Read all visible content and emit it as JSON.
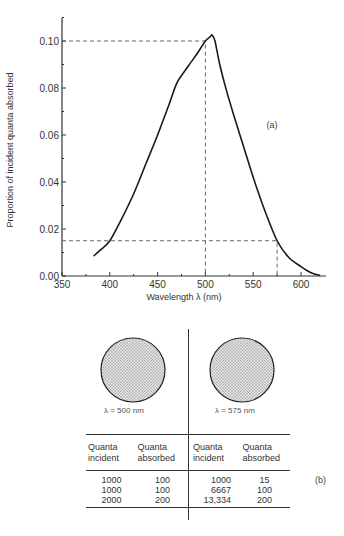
{
  "chart_data": [
    {
      "type": "line",
      "panel": "(a)",
      "title": "",
      "xlabel": "Wavelength λ (nm)",
      "ylabel": "Proportion of incident quanta absorbed",
      "xlim": [
        350,
        625
      ],
      "ylim": [
        0.0,
        0.11
      ],
      "xticks": [
        350,
        400,
        450,
        500,
        550,
        600
      ],
      "yticks": [
        0.0,
        0.02,
        0.04,
        0.06,
        0.08,
        0.1
      ],
      "xtick_labels": [
        "350",
        "400",
        "450",
        "500",
        "550",
        "600"
      ],
      "ytick_labels": [
        "0.00",
        "0.02",
        "0.04",
        "0.06",
        "0.08",
        "0.10"
      ],
      "grid": false,
      "series": [
        {
          "name": "absorption spectrum",
          "x": [
            383,
            390,
            400,
            412,
            425,
            438,
            450,
            462,
            470,
            478,
            485,
            492,
            500,
            505,
            507,
            510,
            515,
            522,
            530,
            540,
            550,
            562,
            575,
            587,
            600,
            610,
            620
          ],
          "y": [
            0.0085,
            0.011,
            0.015,
            0.024,
            0.035,
            0.048,
            0.06,
            0.073,
            0.082,
            0.087,
            0.091,
            0.095,
            0.1,
            0.1018,
            0.1025,
            0.1,
            0.09,
            0.079,
            0.068,
            0.055,
            0.042,
            0.028,
            0.015,
            0.008,
            0.004,
            0.0015,
            0.0002
          ]
        }
      ],
      "annotations": [
        {
          "type": "dashed-reference",
          "x": 500,
          "y": 0.1
        },
        {
          "type": "dashed-reference",
          "x": 575,
          "y": 0.015
        },
        {
          "type": "dashed-reference",
          "x": 400,
          "y": 0.015
        }
      ]
    },
    {
      "type": "table",
      "panel": "(b)",
      "groups": [
        {
          "wavelength_label": "λ = 500  nm",
          "columns": [
            "Quanta incident",
            "Quanta absorbed"
          ],
          "rows": [
            [
              "1000",
              "100"
            ],
            [
              "1000",
              "100"
            ],
            [
              "2000",
              "200"
            ]
          ]
        },
        {
          "wavelength_label": "λ = 575 nm",
          "columns": [
            "Quanta incident",
            "Quanta absorbed"
          ],
          "rows": [
            [
              "1000",
              "15"
            ],
            [
              "6667",
              "100"
            ],
            [
              "13,334",
              "200"
            ]
          ]
        }
      ]
    }
  ],
  "plot": {
    "xlabel": "Wavelength λ (nm)",
    "ylabel": "Proportion of incident quanta absorbed",
    "panel_label": "(a)",
    "xticks": [
      "350",
      "400",
      "450",
      "500",
      "550",
      "600"
    ],
    "yticks": [
      "0.00",
      "0.02",
      "0.04",
      "0.06",
      "0.08",
      "0.10"
    ]
  },
  "panel_b": {
    "label": "(b)",
    "left": {
      "circle_label": "λ = 500  nm",
      "header": [
        "Quanta",
        "incident",
        "Quanta",
        "absorbed"
      ],
      "rows": [
        [
          "1000",
          "100"
        ],
        [
          "1000",
          "100"
        ],
        [
          "2000",
          "200"
        ]
      ]
    },
    "right": {
      "circle_label": "λ = 575 nm",
      "header": [
        "Quanta",
        "incident",
        "Quanta",
        "absorbed"
      ],
      "rows": [
        [
          "1000",
          "15"
        ],
        [
          "6667",
          "100"
        ],
        [
          "13,334",
          "200"
        ]
      ]
    }
  },
  "colors": {
    "ink": "#1a1a1a",
    "dash": "#555555",
    "circle_fill": "#c8c8c8"
  }
}
